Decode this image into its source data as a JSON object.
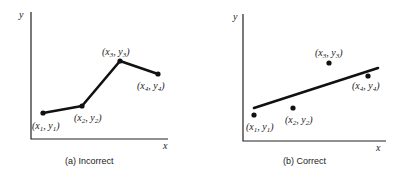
{
  "panels": [
    {
      "id": "a",
      "caption": "(a) Incorrect",
      "x_axis_label": "x",
      "y_axis_label": "y",
      "fit": "polyline through all points",
      "points": [
        {
          "label": "(x1, y1)",
          "sub_x": "1",
          "sub_y": "1"
        },
        {
          "label": "(x2, y2)",
          "sub_x": "2",
          "sub_y": "2"
        },
        {
          "label": "(x3, y3)",
          "sub_x": "3",
          "sub_y": "3"
        },
        {
          "label": "(x4, y4)",
          "sub_x": "4",
          "sub_y": "4"
        }
      ]
    },
    {
      "id": "b",
      "caption": "(b) Correct",
      "x_axis_label": "x",
      "y_axis_label": "y",
      "fit": "straight best-fit line",
      "points": [
        {
          "label": "(x1, y1)",
          "sub_x": "1",
          "sub_y": "1"
        },
        {
          "label": "(x2, y2)",
          "sub_x": "2",
          "sub_y": "2"
        },
        {
          "label": "(x3, y3)",
          "sub_x": "3",
          "sub_y": "3"
        },
        {
          "label": "(x4, y4)",
          "sub_x": "4",
          "sub_y": "4"
        }
      ]
    }
  ]
}
